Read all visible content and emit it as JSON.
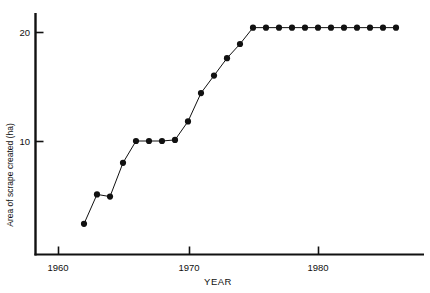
{
  "chart_data": {
    "type": "line",
    "title": "",
    "xlabel": "YEAR",
    "ylabel": "Area of scrape created (ha)",
    "xlim": [
      1958.2,
      1986.9
    ],
    "ylim": [
      0,
      22.6
    ],
    "grid": false,
    "legend": null,
    "x_ticks": [
      1960,
      1970,
      1980
    ],
    "x_tick_labels": [
      "1960",
      "1970",
      "1980"
    ],
    "y_ticks": [
      10,
      20
    ],
    "y_tick_labels": [
      "10",
      "20"
    ],
    "marker": "filled-circle",
    "line_style": "solid-thin",
    "x": [
      1962,
      1963,
      1964,
      1965,
      1966,
      1967,
      1968,
      1969,
      1970,
      1971,
      1972,
      1973,
      1974,
      1975,
      1976,
      1977,
      1978,
      1979,
      1980,
      1981,
      1982,
      1983,
      1984,
      1985,
      1986
    ],
    "values": [
      2.4,
      5.1,
      4.9,
      8.0,
      10.0,
      10.0,
      10.0,
      10.1,
      11.8,
      14.4,
      16.0,
      17.6,
      18.9,
      20.4,
      20.4,
      20.4,
      20.4,
      20.4,
      20.4,
      20.4,
      20.4,
      20.4,
      20.4,
      20.4,
      20.4
    ],
    "series": [
      {
        "name": "Area of scrape created",
        "values": [
          2.4,
          5.1,
          4.9,
          8.0,
          10.0,
          10.0,
          10.0,
          10.1,
          11.8,
          14.4,
          16.0,
          17.6,
          18.9,
          20.4,
          20.4,
          20.4,
          20.4,
          20.4,
          20.4,
          20.4,
          20.4,
          20.4,
          20.4,
          20.4,
          20.4
        ]
      }
    ]
  },
  "axis": {
    "x_title": "YEAR",
    "y_title": "Area of scrape created (ha)",
    "x_tick_1": "1960",
    "x_tick_2": "1970",
    "x_tick_3": "1980",
    "y_tick_1": "10",
    "y_tick_2": "20"
  },
  "colors": {
    "ink": "#111111",
    "background": "#ffffff"
  }
}
